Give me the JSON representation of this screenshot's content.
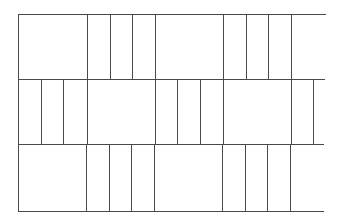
{
  "diagram": {
    "type": "brick-bond-pattern",
    "line_color": "#4a4a4a",
    "background": "#ffffff",
    "left_edge_x": 18,
    "rows": [
      {
        "name": "row-1",
        "top": 14,
        "bottom": 79,
        "right": 326,
        "left_closed": true,
        "verticals": [
          87,
          110,
          132,
          155,
          223,
          246,
          268,
          291
        ]
      },
      {
        "name": "row-2",
        "top": 79,
        "bottom": 144,
        "right": 325,
        "left_closed": true,
        "verticals": [
          41,
          63,
          87,
          155,
          177,
          200,
          223,
          291,
          313
        ]
      },
      {
        "name": "row-3",
        "top": 144,
        "bottom": 211,
        "right": 324,
        "left_closed": true,
        "verticals": [
          86,
          109,
          131,
          154,
          222,
          245,
          267,
          290
        ]
      }
    ]
  }
}
